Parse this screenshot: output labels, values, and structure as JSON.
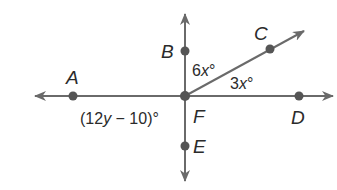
{
  "diagram": {
    "colors": {
      "line": "#6a6a6a",
      "point": "#555555",
      "text": "#2b2b2b"
    },
    "points": {
      "A": {
        "label": "A"
      },
      "B": {
        "label": "B"
      },
      "C": {
        "label": "C"
      },
      "D": {
        "label": "D"
      },
      "E": {
        "label": "E"
      },
      "F": {
        "label": "F"
      }
    },
    "angles": {
      "BFC": {
        "coef": "6",
        "var": "x",
        "deg": "°"
      },
      "CFD": {
        "coef": "3",
        "var": "x",
        "deg": "°"
      },
      "AFE": {
        "open": "(12",
        "var": "y",
        "rest": " − 10)",
        "deg": "°"
      }
    },
    "lines": [
      "line AD (horizontal)",
      "line BE (vertical)",
      "ray FC"
    ]
  }
}
